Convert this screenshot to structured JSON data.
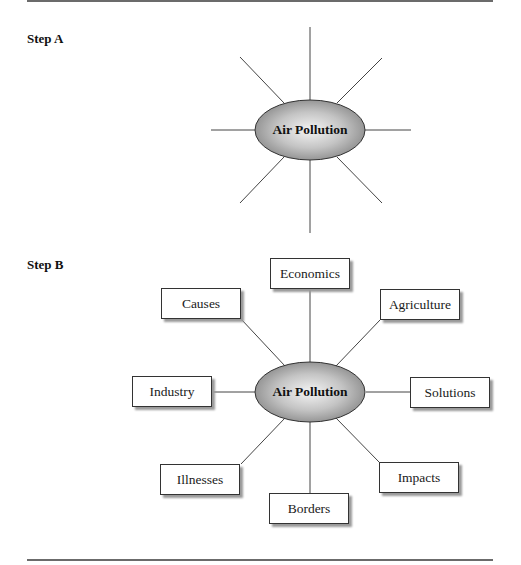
{
  "step_a": {
    "label": "Step A",
    "center": "Air Pollution"
  },
  "step_b": {
    "label": "Step B",
    "center": "Air Pollution",
    "nodes": [
      "Economics",
      "Agriculture",
      "Solutions",
      "Impacts",
      "Borders",
      "Illnesses",
      "Industry",
      "Causes"
    ]
  },
  "colors": {
    "line": "#333333",
    "ellipse_light": "#f2f2f2",
    "ellipse_dark": "#8c8c8c",
    "rule": "#6b6b6b"
  }
}
